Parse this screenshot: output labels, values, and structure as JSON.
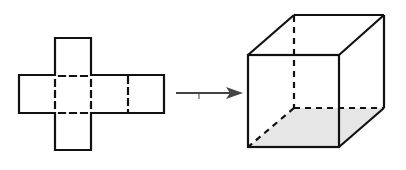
{
  "diagram": {
    "colors": {
      "stroke": "#111111",
      "shade": "#e6e6e6",
      "arrow": "#444444",
      "background": "#ffffff"
    },
    "net": {
      "label": "cube-net",
      "faces": 6,
      "layout": "cross"
    },
    "arrow": {
      "direction": "right",
      "meaning": "folds into"
    },
    "cube": {
      "label": "cube",
      "shaded_face": "bottom"
    }
  }
}
